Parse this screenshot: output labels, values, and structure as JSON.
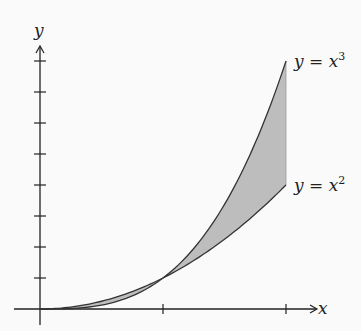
{
  "chart_data": {
    "type": "area",
    "title": "",
    "xlabel": "x",
    "ylabel": "y",
    "xlim": [
      0,
      2
    ],
    "ylim": [
      0,
      8
    ],
    "x_ticks": [
      1,
      2
    ],
    "y_ticks": [
      1,
      2,
      3,
      4,
      5,
      6,
      7,
      8
    ],
    "grid": false,
    "series": [
      {
        "name": "y = x^3",
        "function": "x^3",
        "x": [
          0,
          0.5,
          1,
          1.5,
          2
        ],
        "values": [
          0,
          0.125,
          1,
          3.375,
          8
        ]
      },
      {
        "name": "y = x^2",
        "function": "x^2",
        "x": [
          0,
          0.5,
          1,
          1.5,
          2
        ],
        "values": [
          0,
          0.25,
          1,
          2.25,
          4
        ]
      }
    ],
    "shaded_region": {
      "between": [
        "y = x^3",
        "y = x^2"
      ],
      "x_from": 0,
      "x_to": 2,
      "color": "#bdbdbd"
    },
    "annotations": [
      {
        "text": "y = x",
        "power": "3",
        "at_x": 2,
        "at_y": 8
      },
      {
        "text": "y = x",
        "power": "2",
        "at_x": 2,
        "at_y": 4
      }
    ]
  },
  "labels": {
    "x_axis": "x",
    "y_axis": "y",
    "cubic_base": "y = x",
    "cubic_power": "3",
    "square_base": "y = x",
    "square_power": "2"
  }
}
